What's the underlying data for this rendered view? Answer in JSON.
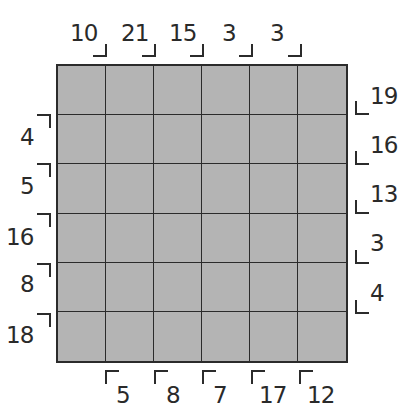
{
  "puzzle": {
    "rows": 6,
    "cols": 6,
    "cell_color": "#b4b4b4",
    "line_color": "#2b2b2b",
    "clues": {
      "top": [
        "10",
        "21",
        "15",
        "3",
        "3"
      ],
      "left": [
        "4",
        "5",
        "16",
        "8",
        "18"
      ],
      "right": [
        "19",
        "16",
        "13",
        "3",
        "4"
      ],
      "bottom": [
        "5",
        "8",
        "7",
        "17",
        "12"
      ]
    }
  }
}
